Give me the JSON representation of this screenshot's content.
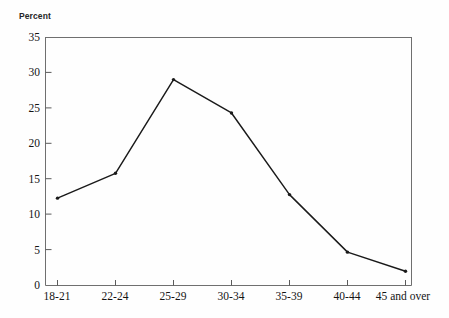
{
  "chart_data": {
    "type": "line",
    "title": "",
    "subtitle": "",
    "ylabel": "Percent",
    "xlabel": "",
    "categories": [
      "18-21",
      "22-24",
      "25-29",
      "30-34",
      "35-39",
      "40-44",
      "45 and over"
    ],
    "values": [
      12.3,
      15.8,
      29.0,
      24.3,
      12.8,
      4.7,
      2.0
    ],
    "series": [
      {
        "name": "Percent",
        "values": [
          12.3,
          15.8,
          29.0,
          24.3,
          12.8,
          4.7,
          2.0
        ]
      }
    ],
    "ylim": [
      0,
      35
    ],
    "ytick_labels": [
      "0",
      "5",
      "10",
      "15",
      "20",
      "25",
      "30",
      "35"
    ],
    "ytick_values": [
      0,
      5,
      10,
      15,
      20,
      25,
      30,
      35
    ],
    "grid": false,
    "legend": false,
    "legend_position": "none",
    "line_color": "#1a1a1a",
    "marker": "dot",
    "frame_color": "#6b6b6b",
    "background": "#fefefe"
  }
}
